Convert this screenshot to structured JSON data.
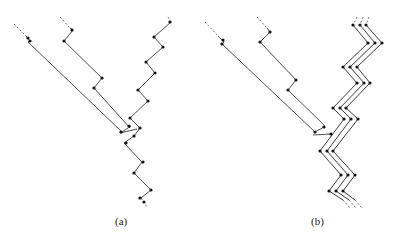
{
  "figure": {
    "panels": [
      {
        "id": "a",
        "label": "(a)",
        "description": "Two diagonal chains merging into a single zigzag chain",
        "dashed_segments": [
          [
            [
              14,
              24
            ],
            [
              26,
              36
            ]
          ],
          [
            [
              60,
              17
            ],
            [
              70,
              28
            ]
          ],
          [
            [
              168,
              17
            ],
            [
              171,
              22
            ]
          ],
          [
            [
              141,
              198
            ],
            [
              147,
              207
            ]
          ]
        ],
        "polylines": [
          [
            [
              26,
              36
            ],
            [
              30,
              41
            ],
            [
              28,
              42
            ],
            [
              122,
              132
            ]
          ],
          [
            [
              70,
              28
            ],
            [
              73,
              30
            ],
            [
              64,
              41
            ],
            [
              102,
              78
            ],
            [
              94,
              88
            ],
            [
              130,
              128
            ]
          ],
          [
            [
              171,
              22
            ],
            [
              154,
              37
            ],
            [
              163,
              47
            ],
            [
              146,
              62
            ],
            [
              155,
              73
            ],
            [
              138,
              90
            ],
            [
              148,
              101
            ],
            [
              130,
              118
            ],
            [
              140,
              128
            ],
            [
              134,
              136
            ],
            [
              124,
              143
            ],
            [
              142,
              162
            ],
            [
              134,
              173
            ],
            [
              151,
              190
            ],
            [
              141,
              198
            ]
          ],
          [
            [
              122,
              132
            ],
            [
              131,
              126
            ]
          ],
          [
            [
              120,
              133
            ],
            [
              137,
              129
            ]
          ]
        ],
        "nodes": [
          [
            28,
            38
          ],
          [
            30,
            41
          ],
          [
            72,
            30
          ],
          [
            64,
            41
          ],
          [
            102,
            78
          ],
          [
            94,
            88
          ],
          [
            170,
            22
          ],
          [
            154,
            37
          ],
          [
            163,
            47
          ],
          [
            146,
            62
          ],
          [
            155,
            73
          ],
          [
            138,
            90
          ],
          [
            148,
            101
          ],
          [
            130,
            118
          ],
          [
            140,
            128
          ],
          [
            129,
            126
          ],
          [
            121,
            132
          ],
          [
            134,
            136
          ],
          [
            126,
            143
          ],
          [
            143,
            162
          ],
          [
            134,
            173
          ],
          [
            151,
            190
          ],
          [
            140,
            198
          ],
          [
            144,
            202
          ]
        ]
      },
      {
        "id": "b",
        "label": "(b)",
        "description": "Two diagonal chains attached to a triple-stranded zigzag chain",
        "dashed_segments": [
          [
            [
              205,
              22
            ],
            [
              218,
              36
            ]
          ],
          [
            [
              257,
              17
            ],
            [
              267,
              28
            ]
          ],
          [
            [
              357,
              17
            ],
            [
              353,
              25
            ]
          ],
          [
            [
              363,
              17
            ],
            [
              360,
              25
            ]
          ],
          [
            [
              369,
              17
            ],
            [
              366,
              25
            ]
          ],
          [
            [
              343,
              200
            ],
            [
              350,
              208
            ]
          ],
          [
            [
              349,
              200
            ],
            [
              356,
              208
            ]
          ],
          [
            [
              355,
              200
            ],
            [
              362,
              208
            ]
          ]
        ],
        "polylines": [
          [
            [
              218,
              36
            ],
            [
              224,
              42
            ],
            [
              222,
              44
            ],
            [
              315,
              132
            ]
          ],
          [
            [
              267,
              28
            ],
            [
              270,
              32
            ],
            [
              260,
              42
            ],
            [
              296,
              80
            ],
            [
              288,
              90
            ],
            [
              325,
              126
            ]
          ],
          [
            [
              315,
              132
            ],
            [
              324,
              127
            ]
          ],
          [
            [
              313,
              135
            ],
            [
              331,
              134
            ]
          ]
        ],
        "strands": [
          [
            [
              353,
              25
            ],
            [
              368,
              43
            ],
            [
              343,
              67
            ],
            [
              357,
              83
            ],
            [
              333,
              108
            ],
            [
              344,
              119
            ],
            [
              320,
              151
            ],
            [
              341,
              175
            ],
            [
              329,
              191
            ],
            [
              343,
              200
            ]
          ],
          [
            [
              360,
              25
            ],
            [
              375,
              43
            ],
            [
              350,
              67
            ],
            [
              364,
              83
            ],
            [
              340,
              108
            ],
            [
              351,
              119
            ],
            [
              327,
              151
            ],
            [
              348,
              175
            ],
            [
              336,
              191
            ],
            [
              349,
              200
            ]
          ],
          [
            [
              366,
              25
            ],
            [
              382,
              43
            ],
            [
              357,
              67
            ],
            [
              370,
              83
            ],
            [
              346,
              108
            ],
            [
              358,
              119
            ],
            [
              333,
              151
            ],
            [
              355,
              175
            ],
            [
              343,
              191
            ],
            [
              355,
              200
            ]
          ]
        ],
        "nodes": [
          [
            223,
            40
          ],
          [
            222,
            44
          ],
          [
            270,
            32
          ],
          [
            260,
            42
          ],
          [
            296,
            80
          ],
          [
            288,
            90
          ],
          [
            324,
            127
          ],
          [
            315,
            132
          ],
          [
            331,
            134
          ],
          [
            353,
            25
          ],
          [
            360,
            25
          ],
          [
            366,
            25
          ],
          [
            368,
            43
          ],
          [
            375,
            43
          ],
          [
            382,
            43
          ],
          [
            343,
            67
          ],
          [
            350,
            67
          ],
          [
            357,
            67
          ],
          [
            357,
            83
          ],
          [
            364,
            83
          ],
          [
            370,
            83
          ],
          [
            333,
            108
          ],
          [
            340,
            108
          ],
          [
            346,
            108
          ],
          [
            344,
            119
          ],
          [
            351,
            119
          ],
          [
            358,
            119
          ],
          [
            320,
            151
          ],
          [
            327,
            151
          ],
          [
            333,
            151
          ],
          [
            341,
            175
          ],
          [
            348,
            175
          ],
          [
            355,
            175
          ],
          [
            329,
            191
          ],
          [
            336,
            191
          ],
          [
            343,
            191
          ]
        ]
      }
    ],
    "colors": {
      "line": "#3a3a3a",
      "node": "#111111",
      "dash": "#666666",
      "background": "#ffffff"
    }
  }
}
